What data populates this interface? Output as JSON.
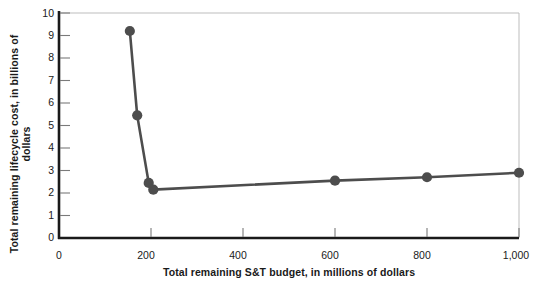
{
  "chart_data": {
    "type": "line",
    "title": "",
    "xlabel": "Total remaining S&T budget, in millions of dollars",
    "ylabel": "Total remaining lifecycle cost, in billions of dollars",
    "xlim": [
      0,
      1000
    ],
    "ylim": [
      0,
      10
    ],
    "grid": false,
    "legend": null,
    "xticks": [
      0,
      200,
      400,
      600,
      800,
      1000
    ],
    "xtick_labels": [
      "0",
      "200",
      "400",
      "600",
      "800",
      "1,000"
    ],
    "yticks": [
      0,
      1,
      2,
      3,
      4,
      5,
      6,
      7,
      8,
      9,
      10
    ],
    "ytick_labels": [
      "0",
      "1",
      "2",
      "3",
      "4",
      "5",
      "6",
      "7",
      "8",
      "9",
      "10"
    ],
    "series": [
      {
        "name": "Total remaining lifecycle cost",
        "color": "#4d4d4d",
        "marker": "circle",
        "x": [
          154,
          170,
          195,
          205,
          600,
          800,
          1000
        ],
        "y": [
          9.2,
          5.45,
          2.45,
          2.15,
          2.55,
          2.7,
          2.9
        ]
      }
    ]
  },
  "axes": {
    "x_title": "Total remaining S&T budget, in millions of dollars",
    "y_title": "Total remaining lifecycle cost, in billions of dollars"
  },
  "colors": {
    "line": "#4d4d4d",
    "marker": "#4d4d4d",
    "axis": "#1a1a1a",
    "frame": "#bdbdbd",
    "text": "#1a1a1a",
    "background": "#ffffff"
  }
}
